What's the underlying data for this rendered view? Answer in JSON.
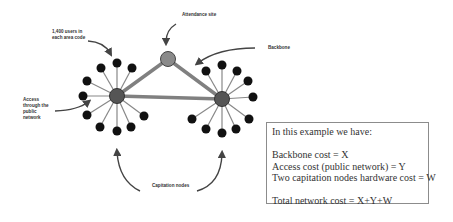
{
  "labels": {
    "users": [
      "1,400 users in",
      "each area code"
    ],
    "attendance_site": "Attendance site",
    "backbone": "Backbone",
    "access": [
      "Access",
      "through the",
      "public",
      "network"
    ],
    "capitation_nodes": "Capitation nodes"
  },
  "info_box": {
    "heading": "In this example we have:",
    "lines": [
      "Backbone cost = X",
      "Access cost (public network) = Y",
      "Two capitation nodes hardware cost = W"
    ],
    "total": "Total network cost = X+Y+W"
  },
  "colors": {
    "hub_fill": "#555555",
    "site_fill": "#8a8a8a",
    "leaf_fill": "#111111",
    "spoke": "#888888",
    "backbone_link": "#808080",
    "arrow": "#444444"
  }
}
